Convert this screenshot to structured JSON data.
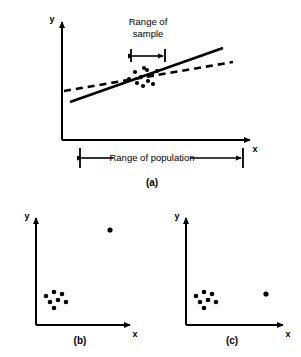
{
  "figure": {
    "background_color": "#ffffff",
    "stroke_color": "#000000",
    "panels": [
      {
        "id": "a",
        "caption": "(a)",
        "axes": {
          "x_label": "x",
          "y_label": "y"
        },
        "annotations": [
          {
            "name": "range-of-sample",
            "line1": "Range of",
            "line2": "sample",
            "text": "Range of sample"
          },
          {
            "name": "range-of-population",
            "text": "Range of population"
          }
        ],
        "lines": [
          {
            "name": "sample-regression-line",
            "style": "solid",
            "description": "steep line fitted to sample"
          },
          {
            "name": "population-regression-line",
            "style": "dashed",
            "description": "shallower line fitted to population"
          }
        ],
        "scatter_points": [
          {
            "x": 129,
            "y": 79
          },
          {
            "x": 135,
            "y": 72
          },
          {
            "x": 137,
            "y": 83
          },
          {
            "x": 141,
            "y": 77
          },
          {
            "x": 143,
            "y": 86
          },
          {
            "x": 147,
            "y": 70
          },
          {
            "x": 148,
            "y": 81
          },
          {
            "x": 152,
            "y": 75
          },
          {
            "x": 153,
            "y": 84
          },
          {
            "x": 157,
            "y": 71
          },
          {
            "x": 144,
            "y": 68
          }
        ]
      },
      {
        "id": "b",
        "caption": "(b)",
        "axes": {
          "x_label": "x",
          "y_label": "y"
        },
        "cluster_points": [
          {
            "x": 46,
            "y": 296
          },
          {
            "x": 54,
            "y": 292
          },
          {
            "x": 62,
            "y": 294
          },
          {
            "x": 50,
            "y": 302
          },
          {
            "x": 58,
            "y": 300
          },
          {
            "x": 66,
            "y": 302
          },
          {
            "x": 54,
            "y": 308
          }
        ],
        "outlier_point": {
          "x": 110,
          "y": 230
        }
      },
      {
        "id": "c",
        "caption": "(c)",
        "axes": {
          "x_label": "x",
          "y_label": "y"
        },
        "cluster_points": [
          {
            "x": 196,
            "y": 296
          },
          {
            "x": 204,
            "y": 292
          },
          {
            "x": 212,
            "y": 294
          },
          {
            "x": 200,
            "y": 302
          },
          {
            "x": 208,
            "y": 300
          },
          {
            "x": 216,
            "y": 302
          },
          {
            "x": 204,
            "y": 308
          }
        ],
        "outlier_point": {
          "x": 266,
          "y": 294
        }
      }
    ]
  }
}
